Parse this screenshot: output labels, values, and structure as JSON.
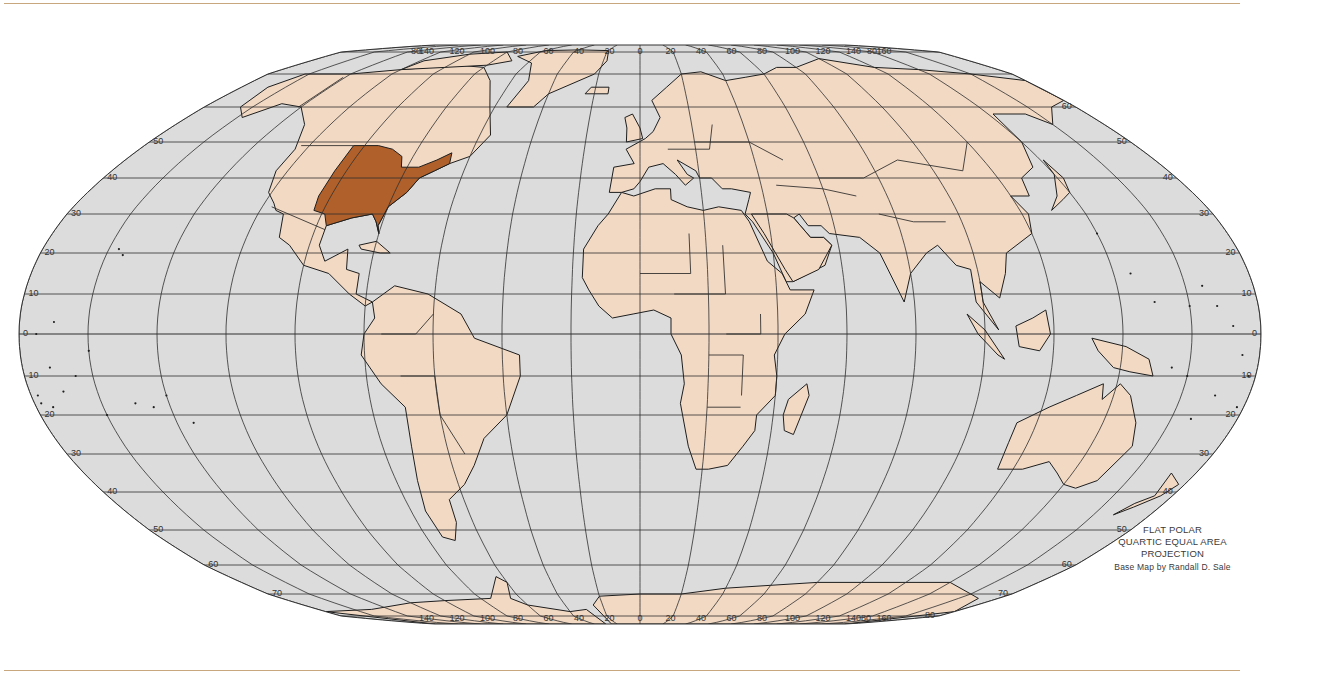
{
  "map": {
    "projection_caption": [
      "FLAT POLAR",
      "QUARTIC EQUAL AREA",
      "PROJECTION"
    ],
    "credit": "Base Map by Randall D. Sale",
    "highlighted_region": "Eastern and Central United States",
    "colors": {
      "ocean": "#dcdcdc",
      "land": "#f2d9c4",
      "highlight": "#b0602a",
      "grid": "#2e2e2e",
      "coast": "#1e1e1e",
      "page_rule": "#c9a77e",
      "caption_text": "#3a3a3a"
    },
    "top_longitude_labels": [
      "80",
      "140",
      "120",
      "100",
      "80",
      "60",
      "40",
      "20",
      "0",
      "20",
      "40",
      "60",
      "80",
      "100",
      "120",
      "140",
      "160",
      "80"
    ],
    "bottom_longitude_labels": [
      "140",
      "120",
      "100",
      "80",
      "60",
      "40",
      "20",
      "0",
      "20",
      "40",
      "60",
      "80",
      "100",
      "120",
      "140",
      "160",
      "80"
    ],
    "left_latitude_labels": [
      "50",
      "40",
      "30",
      "20",
      "10",
      "0",
      "10",
      "20",
      "30",
      "40",
      "50",
      "60",
      "70"
    ],
    "right_latitude_labels": [
      "60",
      "50",
      "40",
      "30",
      "20",
      "10",
      "0",
      "10",
      "20",
      "30",
      "40",
      "50",
      "60",
      "70",
      "80"
    ],
    "latitudes_deg": [
      80,
      70,
      60,
      50,
      40,
      30,
      20,
      10,
      0,
      -10,
      -20,
      -30,
      -40,
      -50,
      -60,
      -70,
      -80
    ],
    "meridian_step_deg": 20
  }
}
